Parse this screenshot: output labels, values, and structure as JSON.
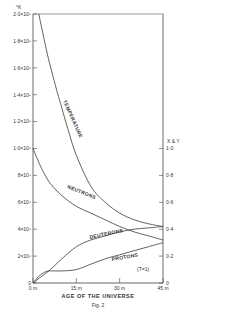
{
  "chart_data": {
    "type": "line",
    "title": "",
    "caption": "Fig. 2",
    "xlabel": "AGE OF THE UNIVERSE",
    "x_ticks": [
      "0 m",
      "15 m",
      "30 m",
      "45 m"
    ],
    "x_range_minutes": [
      0,
      45
    ],
    "left_axis": {
      "unit": "°K",
      "label": "Temperature",
      "ticks": [
        "0",
        "2×10⁸",
        "4×10⁸",
        "6×10⁸",
        "8×10⁸",
        "1·0×10⁹",
        "1·2×10⁹",
        "1·4×10⁹",
        "1·6×10⁹",
        "1·8×10⁹",
        "2·0×10⁹"
      ],
      "range": [
        0,
        2000000000
      ]
    },
    "right_axis": {
      "label": "X & Y",
      "ticks": [
        "0",
        "0·2",
        "0·4",
        "0·6",
        "0·8",
        "1·0"
      ],
      "range": [
        0,
        1.0
      ]
    },
    "annotation": "(T=1)",
    "grid": false,
    "series": [
      {
        "name": "TEMPERATURE",
        "axis": "left",
        "x": [
          2,
          5,
          8,
          10,
          12,
          15,
          20,
          25,
          30,
          35,
          40,
          45
        ],
        "values": [
          2000000000,
          1700000000,
          1450000000,
          1300000000,
          1150000000,
          950000000,
          720000000,
          600000000,
          520000000,
          470000000,
          440000000,
          420000000
        ]
      },
      {
        "name": "NEUTRONS",
        "axis": "right",
        "x": [
          0,
          3,
          6,
          10,
          15,
          20,
          25,
          30,
          35,
          40,
          45
        ],
        "values": [
          1.0,
          0.85,
          0.74,
          0.65,
          0.57,
          0.52,
          0.47,
          0.42,
          0.38,
          0.35,
          0.32
        ]
      },
      {
        "name": "DEUTERONS",
        "axis": "right",
        "x": [
          0,
          3,
          6,
          10,
          15,
          20,
          25,
          30,
          35,
          40,
          45
        ],
        "values": [
          0.0,
          0.05,
          0.1,
          0.18,
          0.27,
          0.32,
          0.35,
          0.38,
          0.4,
          0.41,
          0.42
        ]
      },
      {
        "name": "PROTONS",
        "axis": "right",
        "x": [
          0,
          2,
          4,
          6,
          10,
          15,
          20,
          25,
          30,
          35,
          40,
          45
        ],
        "values": [
          0.0,
          0.05,
          0.08,
          0.09,
          0.09,
          0.1,
          0.14,
          0.18,
          0.21,
          0.24,
          0.27,
          0.3
        ]
      }
    ]
  }
}
